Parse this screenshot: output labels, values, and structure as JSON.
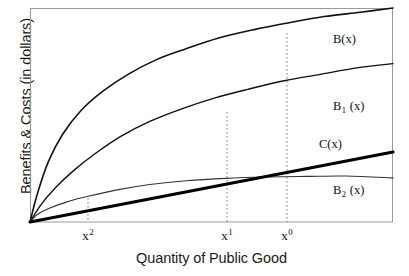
{
  "chart_data": {
    "type": "line",
    "title": "",
    "xlabel": "Quantity of Public Good",
    "ylabel": "Benefits & Costs (in dollars)",
    "grid": false,
    "legend_position": "inline-right",
    "axis_ticks_numeric": false,
    "xlim": [
      0,
      1
    ],
    "ylim": [
      0,
      1
    ],
    "x_tick_labels": [
      "x2",
      "x1",
      "x0"
    ],
    "x_tick_positions": [
      0.16,
      0.543,
      0.708
    ],
    "annotations": [
      "Dotted vertical drop line at x2 from the B2(x)/C(x) crossing to the axis",
      "Dotted vertical drop line at x1 from the B1(x) curve to the axis",
      "Dotted vertical drop line at x0 from the B(x) curve to the axis"
    ],
    "series": [
      {
        "name": "B(x)",
        "label": "B(x)",
        "style": "concave-increasing",
        "linewidth": 1.6,
        "color": "#111111",
        "x": [
          0.0,
          0.02,
          0.05,
          0.09,
          0.14,
          0.2,
          0.27,
          0.35,
          0.43,
          0.52,
          0.62,
          0.71,
          0.81,
          0.91,
          1.0
        ],
        "y": [
          0.0,
          0.13,
          0.28,
          0.41,
          0.52,
          0.61,
          0.69,
          0.76,
          0.81,
          0.86,
          0.9,
          0.93,
          0.96,
          0.98,
          1.0
        ]
      },
      {
        "name": "B1(x)",
        "label": "B1 (x)",
        "style": "concave-increasing",
        "linewidth": 1.4,
        "color": "#111111",
        "x": [
          0.0,
          0.03,
          0.07,
          0.12,
          0.18,
          0.25,
          0.33,
          0.42,
          0.51,
          0.6,
          0.7,
          0.8,
          0.9,
          1.0
        ],
        "y": [
          0.0,
          0.08,
          0.16,
          0.24,
          0.32,
          0.4,
          0.47,
          0.53,
          0.58,
          0.62,
          0.66,
          0.69,
          0.72,
          0.74
        ]
      },
      {
        "name": "C(x)",
        "label": "C(x)",
        "style": "linear",
        "linewidth": 3.2,
        "color": "#000000",
        "x": [
          0.0,
          1.0
        ],
        "y": [
          0.0,
          0.327
        ]
      },
      {
        "name": "B2(x)",
        "label": "B2 (x)",
        "style": "strongly-concave-flattening",
        "linewidth": 1.1,
        "color": "#333333",
        "x": [
          0.0,
          0.02,
          0.05,
          0.1,
          0.16,
          0.24,
          0.33,
          0.43,
          0.54,
          0.65,
          0.76,
          0.87,
          1.0
        ],
        "y": [
          0.0,
          0.035,
          0.062,
          0.093,
          0.12,
          0.15,
          0.175,
          0.193,
          0.204,
          0.21,
          0.213,
          0.215,
          0.206
        ]
      }
    ]
  },
  "labels": {
    "B": "B(x)",
    "B1_base": "B",
    "B1_sub": "1",
    "B1_tail": " (x)",
    "C": "C(x)",
    "B2_base": "B",
    "B2_sub": "2",
    "B2_tail": " (x)"
  },
  "ticks": {
    "x2_base": "x",
    "x2_sup": "2",
    "x1_base": "x",
    "x1_sup": "1",
    "x0_base": "x",
    "x0_sup": "0"
  },
  "colors": {
    "background": "#ffffff",
    "frame": "#9a9a9a",
    "curve": "#111111",
    "cost_line": "#000000",
    "dotted": "#777777",
    "text": "#1a1a1a"
  }
}
